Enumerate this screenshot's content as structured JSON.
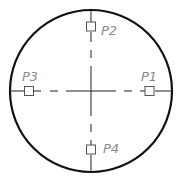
{
  "diagram": {
    "title": "",
    "circle": {
      "cx": 91,
      "cy": 91,
      "r": 81,
      "stroke": "#111111",
      "stroke_width": 2.2
    },
    "centerlines": {
      "color": "#222222",
      "style": "dash-dot center lines"
    },
    "points": [
      {
        "id": "P1",
        "label": "P1",
        "x": 150,
        "y": 91,
        "label_x": 141,
        "label_y": 81
      },
      {
        "id": "P2",
        "label": "P2",
        "x": 91,
        "y": 27,
        "label_x": 101,
        "label_y": 35
      },
      {
        "id": "P3",
        "label": "P3",
        "x": 29,
        "y": 91,
        "label_x": 22,
        "label_y": 81
      },
      {
        "id": "P4",
        "label": "P4",
        "x": 91,
        "y": 150,
        "label_x": 103,
        "label_y": 153
      }
    ],
    "marker_color": "#555555",
    "label_color": "#8a8a8a"
  }
}
